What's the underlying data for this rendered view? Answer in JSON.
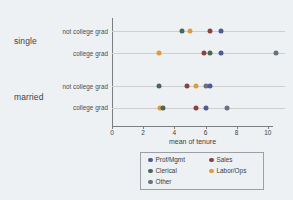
{
  "chart_data": {
    "type": "scatter",
    "title": "",
    "xlabel": "mean of tenure",
    "ylabel": "",
    "xlim": [
      0,
      11.1
    ],
    "xticks": [
      0,
      2,
      4,
      6,
      8,
      10
    ],
    "xtick_labels": [
      "0",
      "2",
      "4",
      "6",
      "8",
      "10"
    ],
    "grid": true,
    "legend_position": "bottom",
    "group_labels": [
      "single",
      "married"
    ],
    "row_labels": [
      "not college grad",
      "college grad",
      "not college grad",
      "college grad"
    ],
    "legend": [
      {
        "label": "Prof/Mgmt",
        "color": "#4f5b92"
      },
      {
        "label": "Clerical",
        "color": "#4a6654"
      },
      {
        "label": "Other",
        "color": "#69707e"
      },
      {
        "label": "Sales",
        "color": "#8c4145"
      },
      {
        "label": "Labor/Ops",
        "color": "#e09a3e"
      }
    ],
    "rows": [
      {
        "group": "single",
        "education": "not college grad",
        "points": [
          {
            "series": "Clerical",
            "value": 4.5,
            "color": "#4a6654"
          },
          {
            "series": "Labor/Ops",
            "value": 5.0,
            "color": "#e09a3e"
          },
          {
            "series": "Sales",
            "value": 6.3,
            "color": "#8c4145"
          },
          {
            "series": "Prof/Mgmt",
            "value": 7.0,
            "color": "#4f5b92"
          }
        ]
      },
      {
        "group": "single",
        "education": "college grad",
        "points": [
          {
            "series": "Labor/Ops",
            "value": 3.0,
            "color": "#e09a3e"
          },
          {
            "series": "Sales",
            "value": 5.9,
            "color": "#8c4145"
          },
          {
            "series": "Clerical",
            "value": 6.3,
            "color": "#4a6654"
          },
          {
            "series": "Prof/Mgmt",
            "value": 7.0,
            "color": "#4f5b92"
          },
          {
            "series": "Other",
            "value": 10.5,
            "color": "#69707e"
          }
        ]
      },
      {
        "group": "married",
        "education": "not college grad",
        "points": [
          {
            "series": "Clerical",
            "value": 3.0,
            "color": "#4a6654"
          },
          {
            "series": "Sales",
            "value": 4.8,
            "color": "#8c4145"
          },
          {
            "series": "Labor/Ops",
            "value": 5.4,
            "color": "#e09a3e"
          },
          {
            "series": "Other",
            "value": 6.0,
            "color": "#69707e"
          },
          {
            "series": "Prof/Mgmt",
            "value": 6.3,
            "color": "#4f5b92"
          }
        ]
      },
      {
        "group": "married",
        "education": "college grad",
        "points": [
          {
            "series": "Labor/Ops",
            "value": 3.1,
            "color": "#e09a3e"
          },
          {
            "series": "Clerical",
            "value": 3.25,
            "color": "#4a6654"
          },
          {
            "series": "Sales",
            "value": 5.4,
            "color": "#8c4145"
          },
          {
            "series": "Prof/Mgmt",
            "value": 6.0,
            "color": "#4f5b92"
          },
          {
            "series": "Other",
            "value": 7.4,
            "color": "#69707e"
          }
        ]
      }
    ]
  }
}
